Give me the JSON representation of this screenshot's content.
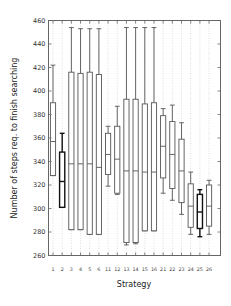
{
  "chart_data": {
    "type": "boxplot",
    "title": "",
    "xlabel": "Strategy",
    "ylabel": "Number of steps req. to finish searching",
    "ylim": [
      260,
      460
    ],
    "yticks": [
      260,
      280,
      300,
      320,
      340,
      360,
      380,
      400,
      420,
      440,
      460
    ],
    "grid": "vertical dotted",
    "categories": [
      "1",
      "2",
      "3",
      "4",
      "5",
      "6",
      "11",
      "12",
      "13",
      "14",
      "15",
      "16",
      "21",
      "22",
      "23",
      "24",
      "25",
      "26"
    ],
    "boxes": [
      {
        "label": "1",
        "min": 328,
        "q1": 328,
        "median": 357,
        "q3": 390,
        "max": 422,
        "bold": false
      },
      {
        "label": "2",
        "min": 301,
        "q1": 301,
        "median": 323,
        "q3": 348,
        "max": 364,
        "bold": true
      },
      {
        "label": "3",
        "min": 282,
        "q1": 282,
        "median": 338,
        "q3": 416,
        "max": 454,
        "bold": false
      },
      {
        "label": "4",
        "min": 282,
        "q1": 282,
        "median": 338,
        "q3": 415,
        "max": 453,
        "bold": false
      },
      {
        "label": "5",
        "min": 278,
        "q1": 278,
        "median": 338,
        "q3": 416,
        "max": 453,
        "bold": false
      },
      {
        "label": "6",
        "min": 278,
        "q1": 278,
        "median": 335,
        "q3": 414,
        "max": 453,
        "bold": false
      },
      {
        "label": "11",
        "min": 319,
        "q1": 329,
        "median": 346,
        "q3": 364,
        "max": 370,
        "bold": false
      },
      {
        "label": "12",
        "min": 312,
        "q1": 313,
        "median": 342,
        "q3": 370,
        "max": 387,
        "bold": false
      },
      {
        "label": "13",
        "min": 269,
        "q1": 271,
        "median": 332,
        "q3": 393,
        "max": 454,
        "bold": false
      },
      {
        "label": "14",
        "min": 270,
        "q1": 271,
        "median": 332,
        "q3": 393,
        "max": 454,
        "bold": false
      },
      {
        "label": "15",
        "min": 281,
        "q1": 281,
        "median": 331,
        "q3": 389,
        "max": 454,
        "bold": false
      },
      {
        "label": "16",
        "min": 281,
        "q1": 281,
        "median": 331,
        "q3": 390,
        "max": 454,
        "bold": false
      },
      {
        "label": "21",
        "min": 313,
        "q1": 326,
        "median": 353,
        "q3": 379,
        "max": 385,
        "bold": false
      },
      {
        "label": "22",
        "min": 307,
        "q1": 317,
        "median": 346,
        "q3": 374,
        "max": 388,
        "bold": false
      },
      {
        "label": "23",
        "min": 295,
        "q1": 305,
        "median": 332,
        "q3": 359,
        "max": 373,
        "bold": false
      },
      {
        "label": "24",
        "min": 278,
        "q1": 284,
        "median": 302,
        "q3": 321,
        "max": 331,
        "bold": false
      },
      {
        "label": "25",
        "min": 276,
        "q1": 283,
        "median": 297,
        "q3": 312,
        "max": 316,
        "bold": true
      },
      {
        "label": "26",
        "min": 278,
        "q1": 285,
        "median": 302,
        "q3": 320,
        "max": 324,
        "bold": false
      }
    ],
    "colors": {
      "box": "#555555",
      "box_bold": "#111111",
      "frame": "#666666",
      "grid": "#c8c8c8"
    }
  }
}
